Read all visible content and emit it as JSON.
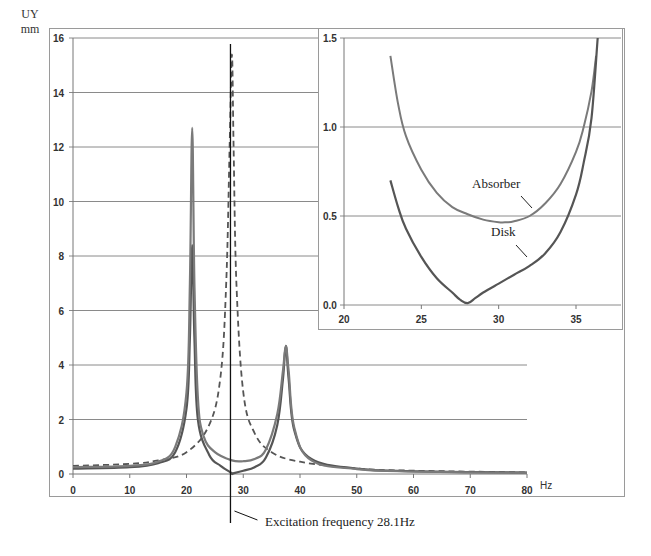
{
  "labels": {
    "y_unit_line1": "UY",
    "y_unit_line2": "mm",
    "x_unit": "Hz",
    "excitation_note": "Excitation frequency 28.1Hz",
    "inset_absorber": "Absorber",
    "inset_disk": "Disk"
  },
  "colors": {
    "grid": "#8a8a8a",
    "frame": "#9a9a9a",
    "disk": "#555555",
    "absorber": "#7a7a7a",
    "dashed": "#555555",
    "marker_line": "#111111"
  },
  "chart_data": [
    {
      "type": "line",
      "title": "",
      "xlabel": "Hz",
      "ylabel": "UY mm",
      "xlim": [
        0,
        80
      ],
      "ylim": [
        0,
        16
      ],
      "x_ticks": [
        0,
        10,
        20,
        30,
        40,
        50,
        60,
        70,
        80
      ],
      "y_ticks": [
        0,
        2,
        4,
        6,
        8,
        10,
        12,
        14,
        16
      ],
      "grid": "horizontal",
      "legend": "none",
      "annotations": [
        {
          "type": "vertical_line",
          "x": 28.1,
          "text": "Excitation frequency 28.1Hz"
        }
      ],
      "series": [
        {
          "name": "Without absorber (dashed)",
          "style": "dashed",
          "x": [
            0,
            10,
            15,
            20,
            24,
            26,
            27,
            27.6,
            28,
            28.3,
            28.8,
            30,
            32,
            35,
            40,
            50,
            60,
            80
          ],
          "values": [
            0.3,
            0.37,
            0.5,
            0.8,
            1.8,
            3.6,
            7.0,
            12.0,
            15.4,
            12.0,
            7.0,
            3.0,
            1.5,
            0.8,
            0.45,
            0.2,
            0.12,
            0.06
          ]
        },
        {
          "name": "Disk",
          "style": "solid-dark",
          "x": [
            0,
            10,
            15,
            18,
            20,
            20.6,
            21,
            21.4,
            22,
            24,
            26,
            28,
            28.1,
            30,
            32,
            34,
            36,
            37,
            37.5,
            38,
            39,
            42,
            50,
            60,
            80
          ],
          "values": [
            0.2,
            0.25,
            0.4,
            0.8,
            2.4,
            5.0,
            8.4,
            5.0,
            2.0,
            0.7,
            0.3,
            0.03,
            0.02,
            0.12,
            0.25,
            0.6,
            1.8,
            3.5,
            4.7,
            3.5,
            1.6,
            0.55,
            0.2,
            0.1,
            0.05
          ]
        },
        {
          "name": "Absorber",
          "style": "solid-light",
          "x": [
            0,
            10,
            15,
            18,
            20,
            20.6,
            21,
            21.4,
            22,
            23,
            25,
            28,
            30,
            32,
            34,
            36,
            37,
            37.5,
            38,
            39,
            42,
            50,
            60,
            80
          ],
          "values": [
            0.25,
            0.3,
            0.45,
            1.0,
            3.0,
            7.0,
            12.7,
            7.0,
            2.8,
            1.4,
            0.8,
            0.5,
            0.47,
            0.55,
            0.9,
            2.2,
            3.8,
            4.7,
            3.8,
            1.7,
            0.5,
            0.18,
            0.09,
            0.04
          ]
        }
      ]
    },
    {
      "type": "line",
      "title": "Inset (zoom 20–37 Hz)",
      "xlabel": "",
      "ylabel": "",
      "xlim": [
        20,
        37
      ],
      "ylim": [
        0,
        1.5
      ],
      "x_ticks": [
        20,
        25,
        30,
        35
      ],
      "y_ticks": [
        0.0,
        0.5,
        1.0,
        1.5
      ],
      "y_tick_labels": [
        "0.0",
        "0.5",
        "1.0",
        "1.5"
      ],
      "grid": "horizontal",
      "annotations": [
        {
          "text": "Absorber",
          "x": 32,
          "y": 0.55
        },
        {
          "text": "Disk",
          "x": 31.5,
          "y": 0.3
        }
      ],
      "series": [
        {
          "name": "Absorber",
          "x": [
            23,
            23.5,
            24,
            25,
            26,
            27,
            28,
            29,
            30,
            30.5,
            31,
            32,
            33,
            34,
            35,
            35.5,
            36,
            36.3
          ],
          "values": [
            1.4,
            1.13,
            0.95,
            0.76,
            0.63,
            0.55,
            0.51,
            0.48,
            0.465,
            0.465,
            0.47,
            0.5,
            0.57,
            0.68,
            0.86,
            1.0,
            1.2,
            1.4
          ]
        },
        {
          "name": "Disk",
          "x": [
            23,
            23.5,
            24,
            25,
            26,
            27,
            27.5,
            28,
            28.5,
            29,
            30,
            31,
            32,
            33,
            34,
            35,
            35.5,
            36,
            36.4
          ],
          "values": [
            0.7,
            0.55,
            0.43,
            0.27,
            0.15,
            0.07,
            0.03,
            0.01,
            0.04,
            0.07,
            0.12,
            0.17,
            0.22,
            0.29,
            0.41,
            0.62,
            0.8,
            1.05,
            1.5
          ]
        }
      ]
    }
  ]
}
